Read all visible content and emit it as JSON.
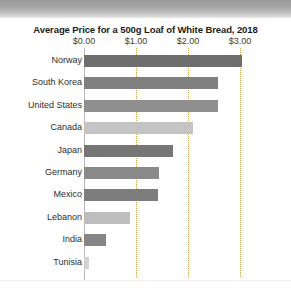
{
  "chart_data": {
    "type": "bar",
    "orientation": "horizontal",
    "title": "Average Price for a 500g Loaf of White Bread, 2018",
    "xlabel": "",
    "ylabel": "",
    "xlim": [
      0,
      3.5
    ],
    "grid": true,
    "legend": false,
    "tick_labels": [
      "$0.00",
      "$1.00",
      "$2.00",
      "$3.00"
    ],
    "tick_values": [
      0,
      1,
      2,
      3
    ],
    "categories": [
      "Norway",
      "South Korea",
      "United States",
      "Canada",
      "Japan",
      "Germany",
      "Mexico",
      "Lebanon",
      "India",
      "Tunisia"
    ],
    "values": [
      3.04,
      2.58,
      2.58,
      2.1,
      1.71,
      1.44,
      1.42,
      0.88,
      0.42,
      0.1
    ],
    "bar_colors": [
      "#6e6e6e",
      "#808080",
      "#8f8f8f",
      "#c4c4c4",
      "#767676",
      "#8a8a8a",
      "#7d7d7d",
      "#bdbdbd",
      "#858585",
      "#d2d2d2"
    ]
  },
  "colors": {
    "gridline": "#c2a24a",
    "axis": "#b8b8b8",
    "title_text": "#1b1b1b",
    "label_text": "#2e2e2e",
    "card_background": "#ffffff",
    "top_band": "#a6a6a6"
  }
}
